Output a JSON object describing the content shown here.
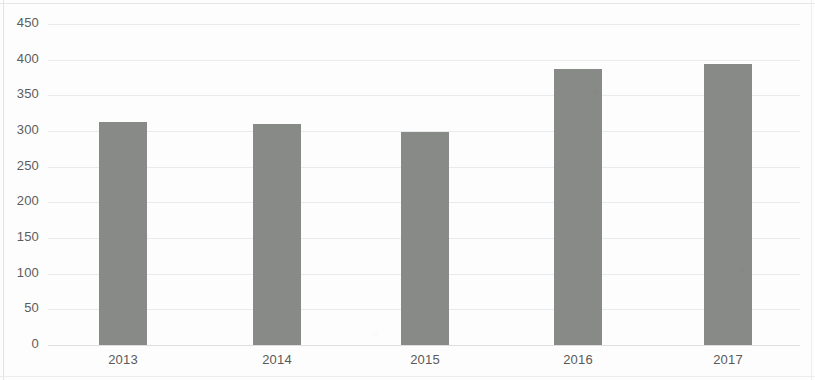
{
  "chart_data": {
    "type": "bar",
    "title": "",
    "subtitle": "",
    "xlabel": "",
    "ylabel": "",
    "categories": [
      "2013",
      "2014",
      "2015",
      "2016",
      "2017"
    ],
    "values": [
      313,
      310,
      299,
      387,
      394
    ],
    "series": [
      {
        "name": "",
        "values": [
          313,
          310,
          299,
          387,
          394
        ]
      }
    ],
    "ylim": [
      0,
      450
    ],
    "yticks": [
      0,
      50,
      100,
      150,
      200,
      250,
      300,
      350,
      400,
      450
    ],
    "ytick_labels": [
      "0",
      "50",
      "100",
      "150",
      "200",
      "250",
      "300",
      "350",
      "400",
      "450"
    ],
    "xtick_labels": [
      "2013",
      "2014",
      "2015",
      "2016",
      "2017"
    ],
    "grid": "horizontal",
    "legend": "none",
    "bar_color": "#888a88",
    "grid_color": "#e9eaec",
    "axis_text_color": "#5c5c5c",
    "background_color": "#fdfdfd",
    "annotations": []
  }
}
